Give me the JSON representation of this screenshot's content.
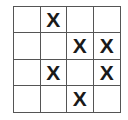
{
  "board": {
    "rows": 4,
    "cols": 4,
    "cells": [
      [
        "",
        "X",
        "",
        ""
      ],
      [
        "",
        "",
        "X",
        "X"
      ],
      [
        "",
        "X",
        "",
        "X"
      ],
      [
        "",
        "",
        "X",
        ""
      ]
    ]
  }
}
